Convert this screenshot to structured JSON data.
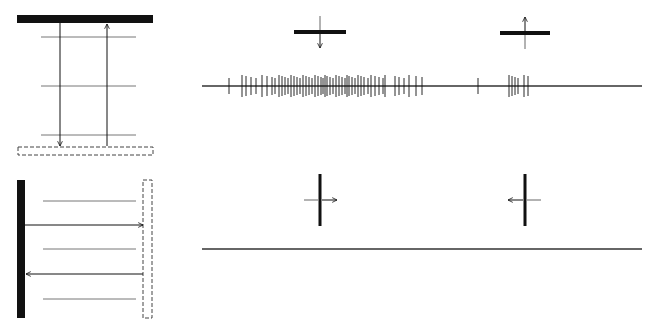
{
  "figure": {
    "colors": {
      "ink": "#111111",
      "line": "#555555",
      "trace": "#333333",
      "background": "#ffffff"
    }
  },
  "panels": {
    "top": {
      "schematic": {
        "orientation": "horizontal",
        "solid_bar": {
          "x": 17,
          "y": 15,
          "w": 136,
          "h": 8
        },
        "dashed_bar": {
          "x": 18,
          "y": 147,
          "w": 135,
          "h": 8
        },
        "grid_lines_y": [
          37,
          86,
          135
        ],
        "grid_x": [
          41,
          136
        ],
        "arrow_down": {
          "x": 60,
          "y1": 23,
          "y2": 146
        },
        "arrow_up": {
          "x": 107,
          "y1": 146,
          "y2": 24
        }
      },
      "stimulus_icons": [
        {
          "label": "downward-motion",
          "cx": 320,
          "cy": 32,
          "bar_w": 52,
          "arrow": "down"
        },
        {
          "label": "upward-motion",
          "cx": 525,
          "cy": 33,
          "bar_w": 50,
          "arrow": "up"
        }
      ],
      "trace": {
        "y": 86,
        "x1": 202,
        "x2": 642,
        "spikes": [
          229,
          242,
          246,
          251,
          256,
          262,
          267,
          272,
          275,
          279,
          282,
          285,
          288,
          291,
          294,
          297,
          300,
          303,
          306,
          309,
          312,
          315,
          318,
          321,
          323,
          325,
          327,
          330,
          333,
          336,
          339,
          342,
          345,
          347,
          349,
          352,
          355,
          358,
          361,
          364,
          368,
          371,
          375,
          379,
          383,
          385,
          395,
          399,
          404,
          409,
          416,
          422,
          478,
          509,
          512,
          515,
          518,
          524,
          528
        ]
      }
    },
    "bottom": {
      "schematic": {
        "orientation": "vertical",
        "solid_bar": {
          "x": 17,
          "y": 180,
          "w": 8,
          "h": 138
        },
        "dashed_bar": {
          "x": 143,
          "y": 180,
          "w": 9,
          "h": 138
        },
        "grid_lines_y": [
          201,
          249,
          299
        ],
        "grid_x": [
          43,
          136
        ],
        "arrow_right": {
          "y": 225,
          "x1": 25,
          "x2": 143
        },
        "arrow_left": {
          "y": 274,
          "x1": 143,
          "x2": 26
        }
      },
      "stimulus_icons": [
        {
          "label": "rightward-motion",
          "cx": 320,
          "cy": 200,
          "bar_h": 52,
          "arrow": "right"
        },
        {
          "label": "leftward-motion",
          "cx": 525,
          "cy": 200,
          "bar_h": 52,
          "arrow": "left"
        }
      ],
      "trace": {
        "y": 249,
        "x1": 202,
        "x2": 642,
        "spikes": []
      }
    }
  }
}
